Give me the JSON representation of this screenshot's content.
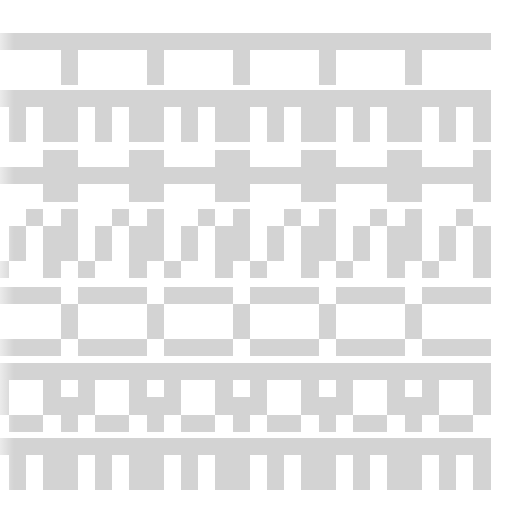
{
  "pattern": {
    "fill_color": "#d3d3d3",
    "background_color": "#ffffff",
    "cell_width": 17.2,
    "cell_height": 17.2,
    "origin_x": -8.2,
    "bands": [
      {
        "name": "t-stem-border",
        "top": 33,
        "rows": [
          "#############################",
          "....#....#....#....#....#....",
          "....#....#....#....#....#...."
        ]
      },
      {
        "name": "comb-border-1",
        "top": 90,
        "rows": [
          "#############################",
          ".#.##.#.##.#.##.#.##.#.##.#.#",
          ".#.##.#.##.#.##.#.##.#.##.#.#"
        ]
      },
      {
        "name": "cross-bar-border",
        "top": 150,
        "rows": [
          "...##...##...##...##...##...#",
          "#############################",
          "...##...##...##...##...##...#"
        ]
      },
      {
        "name": "zigzag-border",
        "top": 209,
        "rows": [
          "..#.#..#.#..#.#..#.#..#.#..#.",
          ".#.##.#.##.#.##.#.##.#.##.#.#",
          ".#.##.#.##.#.##.#.##.#.##.#.#",
          "#..#.#..#.#..#.#..#.#..#.#..#"
        ]
      },
      {
        "name": "box-chain-border",
        "top": 287,
        "rows": [
          "####.####.####.####.####.####",
          "....#....#....#....#....#....",
          "....#....#....#....#....#....",
          "####.####.####.####.####.####"
        ]
      },
      {
        "name": "window-border",
        "top": 363,
        "rows": [
          "#############################",
          "#..#.#..#.#..#.#..#.#..#.#..#",
          "#..###..###..###..###..###..#",
          ".##.#.##.#.##.#.##.#.##.#.##."
        ]
      },
      {
        "name": "comb-border-2",
        "top": 438,
        "rows": [
          "#############################",
          ".#.##.#.##.#.##.#.##.#.##.#.#",
          ".#.##.#.##.#.##.#.##.#.##.#.#"
        ]
      }
    ]
  }
}
